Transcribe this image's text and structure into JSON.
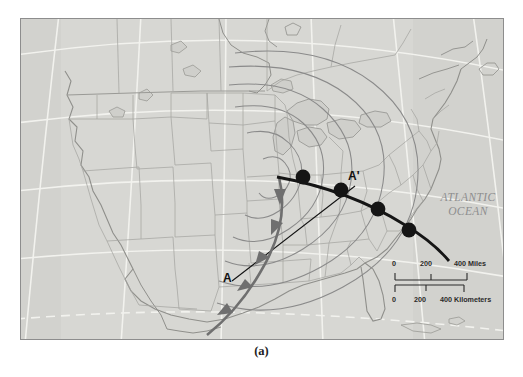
{
  "figure": {
    "caption": "(a)",
    "type": "weather-map",
    "title_visible": false
  },
  "map": {
    "region": "North America / United States",
    "background_color": "#d6d6d2",
    "land_color": "#d8d8d4",
    "border_color": "#8d8d8d",
    "graticule_color": "#ffffff",
    "ocean_label": {
      "line1": "ATLANTIC",
      "line2": "OCEAN",
      "color": "#8e8e8e"
    }
  },
  "weather": {
    "system": "mid-latitude cyclone",
    "isobars": {
      "count": 6,
      "color": "#8a8a8a",
      "shape": "concentric closed loops around low center"
    },
    "low_center": {
      "x": 277,
      "y": 176
    },
    "cold_front": {
      "symbol": "triangles",
      "color": "#6f6f6f",
      "barb_count": 5,
      "direction": "southwest"
    },
    "warm_front": {
      "symbol": "semicircles",
      "color": "#151515",
      "barb_count": 5,
      "direction": "southeast"
    }
  },
  "cross_section": {
    "start_label": "A",
    "end_label": "A'",
    "line_color": "#111111"
  },
  "scalebar": {
    "miles": {
      "ticks": [
        "0",
        "200",
        "400 Miles"
      ],
      "unit": "Miles"
    },
    "kilometers": {
      "ticks": [
        "0",
        "200",
        "400 Kilometers"
      ],
      "unit": "Kilometers"
    }
  }
}
